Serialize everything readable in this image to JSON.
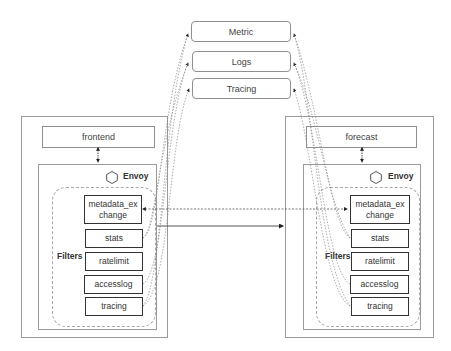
{
  "sinks": [
    {
      "label": "Metric"
    },
    {
      "label": "Logs"
    },
    {
      "label": "Tracing"
    }
  ],
  "left_pod": {
    "service_label": "frontend",
    "envoy_label": "Envoy",
    "filters_label": "Filters",
    "filters": [
      {
        "label": "metadata_ex change"
      },
      {
        "label": "stats"
      },
      {
        "label": "ratelimit"
      },
      {
        "label": "accesslog"
      },
      {
        "label": "tracing"
      }
    ]
  },
  "right_pod": {
    "service_label": "forecast",
    "envoy_label": "Envoy",
    "filters_label": "Filters",
    "filters": [
      {
        "label": "metadata_ex change"
      },
      {
        "label": "stats"
      },
      {
        "label": "ratelimit"
      },
      {
        "label": "accesslog"
      },
      {
        "label": "tracing"
      }
    ]
  },
  "icons": {
    "envoy_icon": "hexagon-icon"
  },
  "colors": {
    "box_border": "#9a9a9a",
    "filter_border": "#333333",
    "connector": "#555555"
  }
}
